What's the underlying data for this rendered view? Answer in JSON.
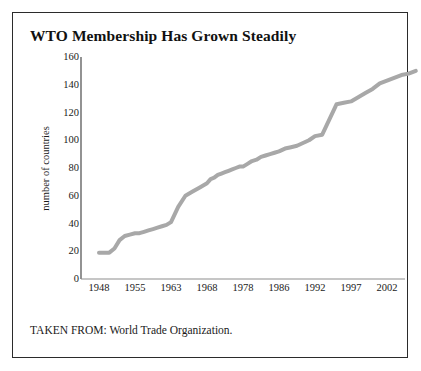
{
  "figure": {
    "title": "WTO Membership Has Grown Steadily",
    "source_note": "TAKEN FROM: World Trade Organization.",
    "border_color": "#2b2b2b",
    "background_color": "#ffffff"
  },
  "chart_data": {
    "type": "line",
    "title": "WTO Membership Has Grown Steadily",
    "xlabel": "",
    "ylabel": "number of countries",
    "ylim": [
      0,
      160
    ],
    "yticks": [
      0,
      20,
      40,
      60,
      80,
      100,
      120,
      140,
      160
    ],
    "xtick_labels": [
      "1948",
      "1955",
      "1963",
      "1968",
      "1978",
      "1986",
      "1992",
      "1997",
      "2002"
    ],
    "grid": false,
    "legend": "none",
    "line_color": "#a8a8a8",
    "line_width": 4,
    "series": [
      {
        "name": "number of countries",
        "x": [
          1948,
          1949,
          1950,
          1951,
          1952,
          1953,
          1954,
          1955,
          1956,
          1957,
          1958,
          1959,
          1960,
          1961,
          1962,
          1963,
          1964,
          1965,
          1966,
          1967,
          1968,
          1969,
          1970,
          1971,
          1972,
          1973,
          1974,
          1975,
          1976,
          1977,
          1978,
          1979,
          1980,
          1981,
          1982,
          1983,
          1984,
          1985,
          1986,
          1987,
          1988,
          1989,
          1990,
          1991,
          1992,
          1993,
          1994,
          1995,
          1996,
          1997,
          1998,
          1999,
          2000,
          2001,
          2002,
          2003,
          2004,
          2005,
          2006
        ],
        "values": [
          19,
          19,
          19,
          22,
          28,
          31,
          32,
          33,
          33,
          34,
          35,
          36,
          37,
          38,
          39,
          41,
          52,
          60,
          63,
          66,
          69,
          72,
          73,
          75,
          76,
          77,
          78,
          79,
          80,
          81,
          81,
          83,
          85,
          86,
          88,
          89,
          90,
          91,
          92,
          94,
          95,
          96,
          98,
          100,
          103,
          104,
          115,
          126,
          127,
          128,
          131,
          134,
          137,
          141,
          143,
          145,
          147,
          148,
          150
        ],
        "annotations": [
          {
            "year": 1948,
            "value": 19,
            "note": "founding level"
          },
          {
            "year": 1963,
            "value": 41,
            "note": "start of rapid 1960s accession wave"
          },
          {
            "year": 1968,
            "value": 69,
            "note": "plateau after 1960s wave"
          },
          {
            "year": 1992,
            "value": 103,
            "note": "pre-WTO level"
          },
          {
            "year": 1995,
            "value": 126,
            "note": "WTO established, sharp jump"
          },
          {
            "year": 2006,
            "value": 150,
            "note": "final value"
          }
        ]
      }
    ]
  }
}
